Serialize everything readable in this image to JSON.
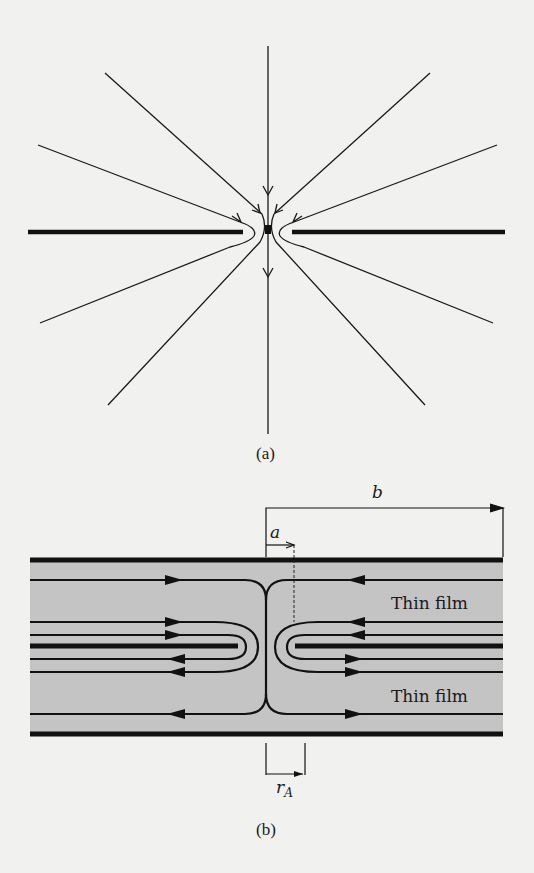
{
  "figure_a": {
    "caption": "(a)",
    "description": "Radial field lines converging to a small aperture in a thin plate, with downward flow through the hole",
    "colors": {
      "line": "#1a1a1a",
      "background": "#f1f1f0"
    }
  },
  "figure_b": {
    "caption": "(b)",
    "dimension_a": "a",
    "dimension_b": "b",
    "dimension_rA_base": "r",
    "dimension_rA_sub": "A",
    "film_labels": [
      "Thin film",
      "Thin film"
    ],
    "colors": {
      "film": "#c4c4c4",
      "line": "#111111",
      "background": "#f1f1f0"
    }
  }
}
